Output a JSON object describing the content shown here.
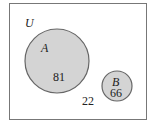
{
  "diagram": {
    "type": "venn",
    "universe_label": "U",
    "sets": [
      {
        "label": "A",
        "value": "81"
      },
      {
        "label": "B",
        "value": "66"
      }
    ],
    "outside_value": "22",
    "colors": {
      "fill": "#d4d4d4",
      "stroke": "#666666",
      "border": "#777777"
    }
  }
}
